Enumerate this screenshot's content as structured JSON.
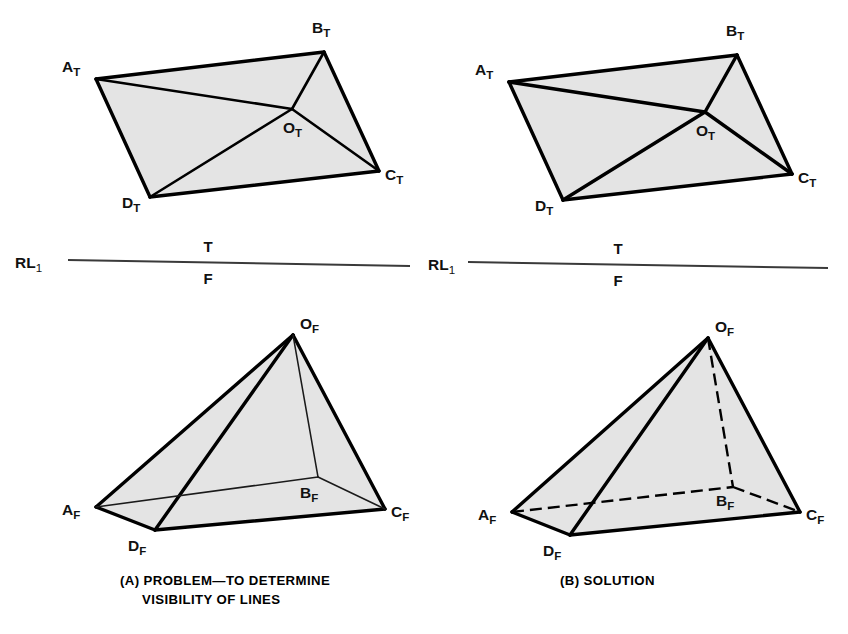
{
  "figure": {
    "background_color": "#ffffff",
    "face_fill_color": "#e4e4e4",
    "line_color": "#000000",
    "reference_line_color": "#3a3a3a"
  },
  "panels": [
    {
      "id": "a",
      "caption_lines": [
        "(A) PROBLEM—TO DETERMINE",
        "VISIBILITY OF LINES"
      ],
      "top_view": {
        "plane": "T",
        "vertices": [
          {
            "key": "A_T",
            "letter": "A",
            "subscript": "T",
            "x": 96,
            "y": 79,
            "label_x": 62,
            "label_y": 72
          },
          {
            "key": "B_T",
            "letter": "B",
            "subscript": "T",
            "x": 324,
            "y": 52,
            "label_x": 312,
            "label_y": 33
          },
          {
            "key": "C_T",
            "letter": "C",
            "subscript": "T",
            "x": 379,
            "y": 171,
            "label_x": 385,
            "label_y": 180
          },
          {
            "key": "D_T",
            "letter": "D",
            "subscript": "T",
            "x": 150,
            "y": 197,
            "label_x": 122,
            "label_y": 208
          },
          {
            "key": "O_T",
            "letter": "O",
            "subscript": "T",
            "x": 292,
            "y": 109,
            "label_x": 283,
            "label_y": 133
          }
        ],
        "outline": [
          "A_T",
          "B_T",
          "C_T",
          "D_T"
        ],
        "edges": [
          {
            "from": "A_T",
            "to": "B_T",
            "style": "heavy"
          },
          {
            "from": "B_T",
            "to": "C_T",
            "style": "heavy"
          },
          {
            "from": "C_T",
            "to": "D_T",
            "style": "heavy"
          },
          {
            "from": "D_T",
            "to": "A_T",
            "style": "heavy"
          },
          {
            "from": "A_T",
            "to": "O_T",
            "style": "medium"
          },
          {
            "from": "B_T",
            "to": "O_T",
            "style": "medium"
          },
          {
            "from": "C_T",
            "to": "O_T",
            "style": "medium"
          },
          {
            "from": "D_T",
            "to": "O_T",
            "style": "medium"
          }
        ]
      },
      "reference_line": {
        "label_letters": "RL",
        "label_subscript": "1",
        "label_x": 15,
        "label_y": 268,
        "x1": 68,
        "y1": 260,
        "x2": 410,
        "y2": 266,
        "upper_plane": "T",
        "upper_x": 208,
        "upper_y": 252,
        "lower_plane": "F",
        "lower_x": 208,
        "lower_y": 284
      },
      "front_view": {
        "plane": "F",
        "vertices": [
          {
            "key": "A_F",
            "letter": "A",
            "subscript": "F",
            "x": 96,
            "y": 507,
            "label_x": 62,
            "label_y": 515
          },
          {
            "key": "B_F",
            "letter": "B",
            "subscript": "F",
            "x": 318,
            "y": 477,
            "label_x": 300,
            "label_y": 498
          },
          {
            "key": "C_F",
            "letter": "C",
            "subscript": "F",
            "x": 385,
            "y": 509,
            "label_x": 391,
            "label_y": 517
          },
          {
            "key": "D_F",
            "letter": "D",
            "subscript": "F",
            "x": 155,
            "y": 530,
            "label_x": 128,
            "label_y": 551
          },
          {
            "key": "O_F",
            "letter": "O",
            "subscript": "F",
            "x": 293,
            "y": 335,
            "label_x": 300,
            "label_y": 329
          }
        ],
        "outline": [
          "O_F",
          "C_F",
          "D_F",
          "A_F"
        ],
        "edges": [
          {
            "from": "O_F",
            "to": "A_F",
            "style": "heavy"
          },
          {
            "from": "O_F",
            "to": "C_F",
            "style": "heavy"
          },
          {
            "from": "O_F",
            "to": "D_F",
            "style": "heavy"
          },
          {
            "from": "A_F",
            "to": "D_F",
            "style": "heavy"
          },
          {
            "from": "D_F",
            "to": "C_F",
            "style": "heavy"
          },
          {
            "from": "A_F",
            "to": "B_F",
            "style": "thin"
          },
          {
            "from": "B_F",
            "to": "C_F",
            "style": "thin"
          },
          {
            "from": "O_F",
            "to": "B_F",
            "style": "thin"
          }
        ]
      }
    },
    {
      "id": "b",
      "caption_lines": [
        "(B) SOLUTION"
      ],
      "top_view": {
        "plane": "T",
        "vertices": [
          {
            "key": "A_T",
            "letter": "A",
            "subscript": "T",
            "x": 509,
            "y": 82,
            "label_x": 475,
            "label_y": 75
          },
          {
            "key": "B_T",
            "letter": "B",
            "subscript": "T",
            "x": 737,
            "y": 55,
            "label_x": 726,
            "label_y": 36
          },
          {
            "key": "C_T",
            "letter": "C",
            "subscript": "T",
            "x": 792,
            "y": 174,
            "label_x": 798,
            "label_y": 183
          },
          {
            "key": "D_T",
            "letter": "D",
            "subscript": "T",
            "x": 563,
            "y": 200,
            "label_x": 535,
            "label_y": 211
          },
          {
            "key": "O_T",
            "letter": "O",
            "subscript": "T",
            "x": 705,
            "y": 112,
            "label_x": 696,
            "label_y": 136
          }
        ],
        "outline": [
          "A_T",
          "B_T",
          "C_T",
          "D_T"
        ],
        "edges": [
          {
            "from": "A_T",
            "to": "B_T",
            "style": "heavy"
          },
          {
            "from": "B_T",
            "to": "C_T",
            "style": "heavy"
          },
          {
            "from": "C_T",
            "to": "D_T",
            "style": "heavy"
          },
          {
            "from": "D_T",
            "to": "A_T",
            "style": "heavy"
          },
          {
            "from": "A_T",
            "to": "O_T",
            "style": "heavy"
          },
          {
            "from": "B_T",
            "to": "O_T",
            "style": "heavy"
          },
          {
            "from": "C_T",
            "to": "O_T",
            "style": "heavy"
          },
          {
            "from": "D_T",
            "to": "O_T",
            "style": "heavy"
          }
        ]
      },
      "reference_line": {
        "label_letters": "RL",
        "label_subscript": "1",
        "label_x": 428,
        "label_y": 270,
        "x1": 468,
        "y1": 262,
        "x2": 828,
        "y2": 268,
        "upper_plane": "T",
        "upper_x": 618,
        "upper_y": 254,
        "lower_plane": "F",
        "lower_x": 618,
        "lower_y": 286
      },
      "front_view": {
        "plane": "F",
        "vertices": [
          {
            "key": "A_F",
            "letter": "A",
            "subscript": "F",
            "x": 512,
            "y": 512,
            "label_x": 478,
            "label_y": 520
          },
          {
            "key": "B_F",
            "letter": "B",
            "subscript": "F",
            "x": 733,
            "y": 487,
            "label_x": 716,
            "label_y": 506
          },
          {
            "key": "C_F",
            "letter": "C",
            "subscript": "F",
            "x": 800,
            "y": 512,
            "label_x": 806,
            "label_y": 520
          },
          {
            "key": "D_F",
            "letter": "D",
            "subscript": "F",
            "x": 570,
            "y": 535,
            "label_x": 543,
            "label_y": 556
          },
          {
            "key": "O_F",
            "letter": "O",
            "subscript": "F",
            "x": 708,
            "y": 338,
            "label_x": 715,
            "label_y": 332
          }
        ],
        "outline": [
          "O_F",
          "C_F",
          "D_F",
          "A_F"
        ],
        "edges": [
          {
            "from": "O_F",
            "to": "A_F",
            "style": "heavy"
          },
          {
            "from": "O_F",
            "to": "C_F",
            "style": "heavy"
          },
          {
            "from": "O_F",
            "to": "D_F",
            "style": "heavy"
          },
          {
            "from": "A_F",
            "to": "D_F",
            "style": "heavy"
          },
          {
            "from": "D_F",
            "to": "C_F",
            "style": "heavy"
          },
          {
            "from": "A_F",
            "to": "B_F",
            "style": "hidden"
          },
          {
            "from": "B_F",
            "to": "C_F",
            "style": "hidden"
          },
          {
            "from": "O_F",
            "to": "B_F",
            "style": "hidden"
          }
        ]
      }
    }
  ],
  "captions": {
    "a": {
      "x": 120,
      "y": 585,
      "line_height": 19
    },
    "b": {
      "x": 560,
      "y": 585,
      "line_height": 19
    }
  }
}
